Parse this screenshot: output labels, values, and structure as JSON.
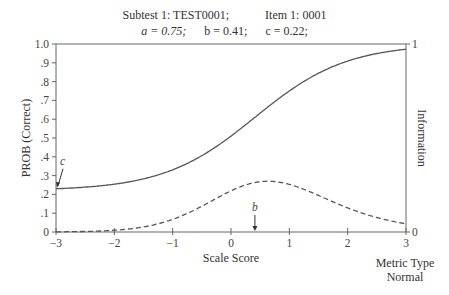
{
  "chart_data": {
    "type": "line",
    "title_line1": {
      "subtest": "Subtest 1: TEST0001;",
      "item": "Item 1: 0001"
    },
    "title_line2": {
      "a": "a = 0.75;",
      "b": "b = 0.41;",
      "c": "c = 0.22;"
    },
    "params": {
      "a": 0.75,
      "b": 0.41,
      "c": 0.22,
      "D": 1.7
    },
    "xlabel": "Scale Score",
    "ylabel_left": "PROB (Correct)",
    "ylabel_right": "Information",
    "metric_label_1": "Metric Type",
    "metric_label_2": "Normal",
    "xlim": [
      -3,
      3
    ],
    "ylim_left": [
      0,
      1
    ],
    "ylim_right": [
      0,
      1
    ],
    "x_ticks": [
      "-3",
      "-2",
      "-1",
      "0",
      "1",
      "2",
      "3"
    ],
    "y_ticks_left": [
      "0",
      ".1",
      ".2",
      ".3",
      ".4",
      ".5",
      ".6",
      ".7",
      ".8",
      ".9",
      "1.0"
    ],
    "y_ticks_right": [
      "0",
      "1"
    ],
    "annotations": [
      {
        "text": "c",
        "at_x": -3,
        "at_y": 0.23
      },
      {
        "text": "b",
        "at_x": 0.41,
        "at_y": 0
      }
    ],
    "series": [
      {
        "name": "Item Characteristic Curve",
        "style": "solid",
        "axis": "left",
        "x": [
          -3,
          -2.5,
          -2,
          -1.5,
          -1,
          -0.5,
          0,
          0.5,
          1,
          1.5,
          2,
          2.5,
          3
        ],
        "values": [
          0.23,
          0.24,
          0.25,
          0.28,
          0.32,
          0.39,
          0.49,
          0.61,
          0.73,
          0.83,
          0.89,
          0.94,
          0.97
        ]
      },
      {
        "name": "Item Information",
        "style": "dashed",
        "axis": "right",
        "x": [
          -3,
          -2.5,
          -2,
          -1.5,
          -1,
          -0.5,
          0,
          0.5,
          1,
          1.5,
          2,
          2.5,
          3
        ],
        "values": [
          0.0,
          0.0,
          0.01,
          0.04,
          0.09,
          0.16,
          0.23,
          0.27,
          0.25,
          0.19,
          0.12,
          0.07,
          0.04
        ]
      }
    ],
    "grid": false,
    "legend": "none"
  }
}
